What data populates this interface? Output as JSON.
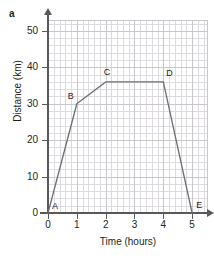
{
  "part_label": "a",
  "chart_data": {
    "type": "line",
    "title": "",
    "xlabel": "Time (hours)",
    "ylabel": "Distance (km)",
    "xlim": [
      0,
      5.55
    ],
    "ylim": [
      0,
      53
    ],
    "xticks": [
      0,
      1,
      2,
      3,
      4,
      5
    ],
    "xtick_labels": [
      "0",
      "1",
      "2",
      "3",
      "4",
      "5"
    ],
    "yticks": [
      0,
      10,
      20,
      30,
      40,
      50
    ],
    "ytick_labels": [
      "0",
      "10",
      "20",
      "30",
      "40",
      "50"
    ],
    "grid": true,
    "grid_minor_step_x": 0.2,
    "grid_minor_step_y": 2,
    "legend": "none",
    "line_color": "#6d6e71",
    "grid_color": "#c9c6cc",
    "axis_color": "#58595b",
    "series": [
      {
        "name": "journey",
        "x": [
          0,
          1,
          2,
          4,
          5
        ],
        "y": [
          0,
          30,
          36,
          36,
          0
        ]
      }
    ],
    "point_labels": [
      {
        "name": "A",
        "x": 0,
        "y": 0,
        "label": "A"
      },
      {
        "name": "B",
        "x": 1,
        "y": 30,
        "label": "B"
      },
      {
        "name": "C",
        "x": 2,
        "y": 36,
        "label": "C"
      },
      {
        "name": "D",
        "x": 4,
        "y": 36,
        "label": "D"
      },
      {
        "name": "E",
        "x": 5,
        "y": 0,
        "label": "E"
      }
    ]
  }
}
